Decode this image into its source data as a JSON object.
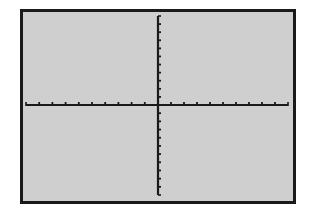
{
  "chart_data": {
    "type": "line",
    "title": "",
    "xlabel": "",
    "ylabel": "",
    "series": [],
    "xlim": [
      -10,
      10
    ],
    "ylim": [
      -10,
      10
    ],
    "xscl": 1,
    "yscl": 1,
    "grid": false,
    "legend": null,
    "axes_only": true,
    "x_ticks_each_side": 9,
    "y_ticks_each_side": 10
  },
  "colors": {
    "screen_background": "#cfcfcf",
    "frame": "#1a1a1a",
    "axes": "#1a1a1a",
    "page_background": "#ffffff"
  },
  "layout": {
    "origin_px": [
      158,
      105
    ],
    "x_axis_px": [
      26,
      288
    ],
    "y_axis_px": [
      16,
      195
    ],
    "x_tick_spacing_px": 13.1,
    "y_tick_spacing_px": 8.9,
    "tick_length_px": 3
  }
}
